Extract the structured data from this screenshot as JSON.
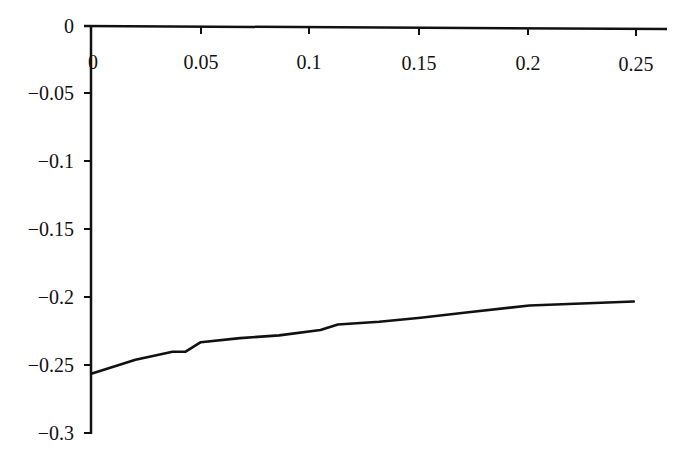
{
  "chart_data": {
    "type": "line",
    "title": "",
    "xlabel": "",
    "ylabel": "",
    "xlim": [
      0,
      0.26
    ],
    "ylim": [
      -0.3,
      0
    ],
    "grid": false,
    "legend": null,
    "x_ticks": [
      0,
      0.05,
      0.1,
      0.15,
      0.2,
      0.25
    ],
    "x_tick_labels": [
      "0",
      "0.05",
      "0.1",
      "0.15",
      "0.2",
      "0.25"
    ],
    "y_ticks": [
      0,
      -0.05,
      -0.1,
      -0.15,
      -0.2,
      -0.25,
      -0.3
    ],
    "y_tick_labels": [
      "0",
      "-0.05",
      "-0.1",
      "-0.15",
      "-0.2",
      "-0.25",
      "-0.3"
    ],
    "x_axis_position": "top (at y=0)",
    "series": [
      {
        "name": "curve",
        "color": "#111111",
        "x": [
          0,
          0.02,
          0.037,
          0.043,
          0.05,
          0.068,
          0.086,
          0.105,
          0.113,
          0.132,
          0.151,
          0.173,
          0.201,
          0.249
        ],
        "y": [
          -0.256,
          -0.246,
          -0.24,
          -0.24,
          -0.233,
          -0.23,
          -0.228,
          -0.224,
          -0.22,
          -0.218,
          -0.215,
          -0.211,
          -0.206,
          -0.203
        ]
      }
    ]
  },
  "axis_labels": {
    "x": [
      "0",
      "0.05",
      "0.1",
      "0.15",
      "0.2",
      "0.25"
    ],
    "y": [
      "0",
      "−0.05",
      "−0.1",
      "−0.15",
      "−0.2",
      "−0.25",
      "−0.3"
    ]
  }
}
